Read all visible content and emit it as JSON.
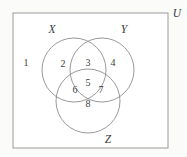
{
  "figure": {
    "background_color": "#fbfbfa",
    "stroke_color": "#8d8d8d",
    "rect_stroke_color": "#9a9a9a",
    "text_color": "#3d3d3d"
  },
  "universe": {
    "label": "U",
    "label_x": 177,
    "label_y": 13,
    "rect": {
      "x": 13,
      "y": 13,
      "width": 155,
      "height": 135
    }
  },
  "sets": [
    {
      "name": "set-x",
      "label": "X",
      "label_x": 52,
      "label_y": 30,
      "cx": 74,
      "cy": 70,
      "r": 32
    },
    {
      "name": "set-y",
      "label": "Y",
      "label_x": 124,
      "label_y": 30,
      "cx": 102,
      "cy": 70,
      "r": 32
    },
    {
      "name": "set-z",
      "label": "Z",
      "label_x": 108,
      "label_y": 140,
      "cx": 88,
      "cy": 101,
      "r": 32
    }
  ],
  "regions": [
    {
      "name": "region-outside-all",
      "number": "1",
      "x": 26,
      "y": 64,
      "description": "outside X, Y and Z"
    },
    {
      "name": "region-x-only",
      "number": "2",
      "x": 63,
      "y": 65,
      "description": "X only"
    },
    {
      "name": "region-x-and-y",
      "number": "3",
      "x": 88,
      "y": 64,
      "description": "X and Y"
    },
    {
      "name": "region-y-only",
      "number": "4",
      "x": 113,
      "y": 64,
      "description": "Y only"
    },
    {
      "name": "region-x-y-and-z",
      "number": "5",
      "x": 88,
      "y": 84,
      "description": "X, Y and Z"
    },
    {
      "name": "region-x-and-z",
      "number": "6",
      "x": 75,
      "y": 91,
      "description": "X and Z"
    },
    {
      "name": "region-y-and-z",
      "number": "7",
      "x": 101,
      "y": 91,
      "description": "Y and Z"
    },
    {
      "name": "region-z-only",
      "number": "8",
      "x": 88,
      "y": 105,
      "description": "Z only"
    }
  ]
}
